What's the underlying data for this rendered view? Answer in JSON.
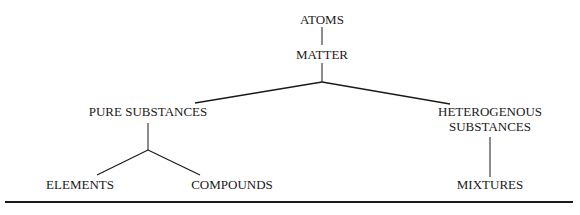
{
  "diagram": {
    "type": "tree",
    "nodes": {
      "atoms": {
        "label": "ATOMS"
      },
      "matter": {
        "label": "MATTER"
      },
      "pure_substances": {
        "label": "PURE SUBSTANCES"
      },
      "heterogenous_substances": {
        "line1": "HETEROGENOUS",
        "line2": "SUBSTANCES"
      },
      "elements": {
        "label": "ELEMENTS"
      },
      "compounds": {
        "label": "COMPOUNDS"
      },
      "mixtures": {
        "label": "MIXTURES"
      }
    },
    "edges": [
      [
        "atoms",
        "matter"
      ],
      [
        "matter",
        "pure_substances"
      ],
      [
        "matter",
        "heterogenous_substances"
      ],
      [
        "pure_substances",
        "elements"
      ],
      [
        "pure_substances",
        "compounds"
      ],
      [
        "heterogenous_substances",
        "mixtures"
      ]
    ],
    "colors": {
      "line": "#1a1a1a",
      "text": "#1a1a1a",
      "background": "#ffffff"
    }
  }
}
